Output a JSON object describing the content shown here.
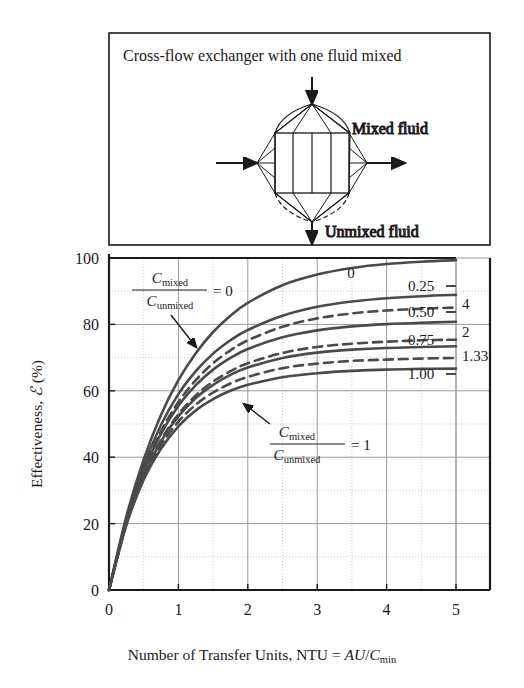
{
  "figure": {
    "box_title": "Cross-flow exchanger with one fluid mixed",
    "schematic": {
      "mixed_label": "Mixed fluid",
      "unmixed_label": "Unmixed fluid",
      "shape_name": "cross-flow-heat-exchanger-diagram"
    }
  },
  "chart_data": {
    "type": "line",
    "title": "Cross-flow exchanger with one fluid mixed",
    "xlabel": "Number of Transfer Units, NTU = AU/Cmin",
    "ylabel": "Effectiveness, ℰ (%)",
    "xlim": [
      0,
      5.5
    ],
    "ylim": [
      0,
      100
    ],
    "xticks": [
      "0",
      "1",
      "2",
      "3",
      "4",
      "5"
    ],
    "xtick_values": [
      0,
      1,
      2,
      3,
      4,
      5
    ],
    "yticks": [
      "0",
      "20",
      "40",
      "60",
      "80",
      "100"
    ],
    "ytick_values": [
      0,
      20,
      40,
      60,
      80,
      100
    ],
    "grid": "major solid every 1 NTU and 20%, minor dotted at midpoints",
    "legend_position": "inline curve-end labels",
    "annotations": [
      {
        "name": "upper-ratio-annotation",
        "numerator": "C",
        "numerator_sub": "mixed",
        "denominator": "C",
        "denominator_sub": "unmixed",
        "equals": "= 0"
      },
      {
        "name": "lower-ratio-annotation",
        "numerator": "C",
        "numerator_sub": "mixed",
        "denominator": "C",
        "denominator_sub": "unmixed",
        "equals": "= 1"
      }
    ],
    "series": [
      {
        "name": "Cmixed/Cunmixed = 0",
        "label": "0",
        "style": "solid",
        "x": [
          0,
          0.25,
          0.5,
          0.75,
          1.0,
          1.25,
          1.5,
          1.75,
          2.0,
          2.5,
          3.0,
          3.5,
          4.0,
          4.5,
          5.0
        ],
        "y": [
          0,
          22.1,
          39.3,
          52.8,
          63.2,
          71.3,
          77.7,
          82.6,
          86.5,
          91.8,
          95.0,
          97.0,
          98.2,
          98.9,
          99.3
        ]
      },
      {
        "name": "Cmixed/Cunmixed = 0.25",
        "label": "0.25",
        "style": "solid",
        "x": [
          0,
          0.25,
          0.5,
          0.75,
          1.0,
          1.25,
          1.5,
          1.75,
          2.0,
          2.5,
          3.0,
          3.5,
          4.0,
          4.5,
          5.0
        ],
        "y": [
          0,
          21.4,
          37.5,
          49.8,
          59.0,
          65.9,
          71.2,
          75.2,
          78.3,
          82.6,
          85.3,
          86.9,
          87.9,
          88.5,
          88.9
        ]
      },
      {
        "name": "Cmixed/Cunmixed = 4",
        "label": "4",
        "style": "dashed",
        "x": [
          0,
          0.25,
          0.5,
          0.75,
          1.0,
          1.25,
          1.5,
          1.75,
          2.0,
          2.5,
          3.0,
          3.5,
          4.0,
          4.5,
          5.0
        ],
        "y": [
          0,
          20.8,
          36.2,
          47.8,
          56.6,
          63.2,
          68.3,
          72.2,
          75.2,
          79.3,
          81.8,
          83.3,
          84.2,
          84.7,
          85.1
        ]
      },
      {
        "name": "Cmixed/Cunmixed = 0.50",
        "label": "0.50",
        "style": "solid",
        "x": [
          0,
          0.25,
          0.5,
          0.75,
          1.0,
          1.25,
          1.5,
          1.75,
          2.0,
          2.5,
          3.0,
          3.5,
          4.0,
          4.5,
          5.0
        ],
        "y": [
          0,
          20.7,
          35.9,
          47.1,
          55.5,
          61.7,
          66.4,
          69.9,
          72.6,
          76.1,
          78.2,
          79.4,
          80.1,
          80.5,
          80.8
        ]
      },
      {
        "name": "Cmixed/Cunmixed = 2",
        "label": "2",
        "style": "dashed",
        "x": [
          0,
          0.25,
          0.5,
          0.75,
          1.0,
          1.25,
          1.5,
          1.75,
          2.0,
          2.5,
          3.0,
          3.5,
          4.0,
          4.5,
          5.0
        ],
        "y": [
          0,
          20.2,
          34.7,
          45.2,
          52.9,
          58.6,
          62.8,
          65.9,
          68.3,
          71.4,
          73.2,
          74.2,
          74.8,
          75.2,
          75.4
        ]
      },
      {
        "name": "Cmixed/Cunmixed = 0.75",
        "label": "0.75",
        "style": "solid",
        "x": [
          0,
          0.25,
          0.5,
          0.75,
          1.0,
          1.25,
          1.5,
          1.75,
          2.0,
          2.5,
          3.0,
          3.5,
          4.0,
          4.5,
          5.0
        ],
        "y": [
          0,
          20.1,
          34.5,
          44.8,
          52.3,
          57.8,
          61.8,
          64.8,
          67.0,
          69.9,
          71.5,
          72.4,
          72.9,
          73.2,
          73.4
        ]
      },
      {
        "name": "Cmixed/Cunmixed = 1.33",
        "label": "1.33",
        "style": "dashed",
        "x": [
          0,
          0.25,
          0.5,
          0.75,
          1.0,
          1.25,
          1.5,
          1.75,
          2.0,
          2.5,
          3.0,
          3.5,
          4.0,
          4.5,
          5.0
        ],
        "y": [
          0,
          19.8,
          33.8,
          43.6,
          50.7,
          55.8,
          59.5,
          62.2,
          64.2,
          66.8,
          68.2,
          69.0,
          69.4,
          69.7,
          69.9
        ]
      },
      {
        "name": "Cmixed/Cunmixed = 1.00",
        "label": "1.00",
        "style": "solid",
        "x": [
          0,
          0.25,
          0.5,
          0.75,
          1.0,
          1.25,
          1.5,
          1.75,
          2.0,
          2.5,
          3.0,
          3.5,
          4.0,
          4.5,
          5.0
        ],
        "y": [
          0,
          19.5,
          33.2,
          42.6,
          49.3,
          54.1,
          57.5,
          60.0,
          61.8,
          64.1,
          65.3,
          66.0,
          66.4,
          66.6,
          66.7
        ]
      }
    ]
  },
  "colors": {
    "curve": "#4a4a4a",
    "grid_major": "#9a9a9a",
    "grid_minor": "#bdbdbd",
    "axis": "#1a1a1a",
    "text": "#1a1a1a"
  }
}
